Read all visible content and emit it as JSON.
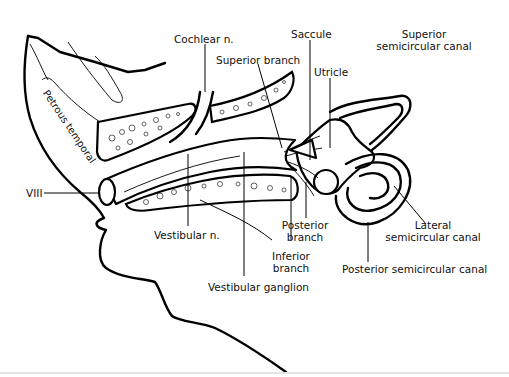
{
  "diagram": {
    "labels": {
      "cochlear_n": "Cochlear n.",
      "superior_branch": "Superior branch",
      "saccule": "Saccule",
      "superior_canal_line1": "Superior",
      "superior_canal_line2": "semicircular canal",
      "utricle": "Utricle",
      "petrous_temporal": "Petrous temporal",
      "viii": "VIII",
      "vestibular_n": "Vestibular n.",
      "posterior_branch_line1": "Posterior",
      "posterior_branch_line2": "branch",
      "lateral_canal_line1": "Lateral",
      "lateral_canal_line2": "semicircular canal",
      "inferior_branch_line1": "Inferior",
      "inferior_branch_line2": "branch",
      "posterior_canal": "Posterior semicircular canal",
      "vestibular_ganglion": "Vestibular ganglion"
    },
    "colors": {
      "line": "#000000",
      "background": "#ffffff"
    }
  }
}
